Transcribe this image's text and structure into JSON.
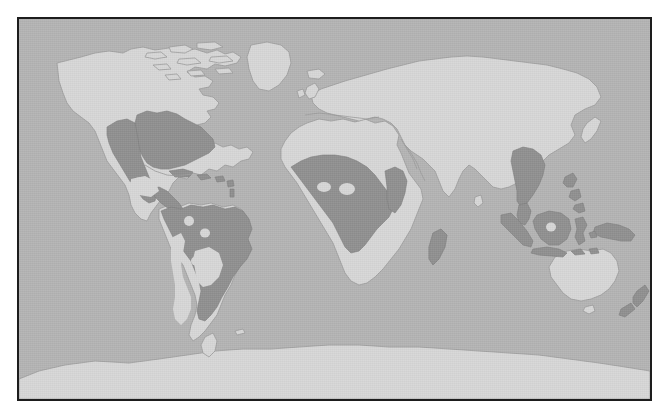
{
  "figure": {
    "kind": "world-distribution-map",
    "projection": "equirectangular",
    "title": "",
    "caption": "",
    "frame": {
      "border_color": "#1d1d1d",
      "border_width_px": 2,
      "x": 17,
      "y": 17,
      "width": 635,
      "height": 384
    }
  },
  "palette": {
    "page_background": "#ffffff",
    "ocean": "#b3b3b3",
    "land_outside_range": "#d6d6d6",
    "land_in_range": "#8f8f8f",
    "coastline_stroke": "#9a9a9a",
    "range_stroke": "#7c7c7c"
  },
  "legend": {
    "present": false,
    "entries": [
      {
        "label": "Distribution range",
        "swatch": "#8f8f8f"
      },
      {
        "label": "Land outside range",
        "swatch": "#d6d6d6"
      },
      {
        "label": "Ocean",
        "swatch": "#b3b3b3"
      }
    ]
  },
  "regions": {
    "shaded_in_range": [
      "Eastern United States",
      "Central United States",
      "Southwestern United States",
      "Mexico (coastal lowlands)",
      "Central America",
      "Caribbean islands",
      "Colombia and Venezuela",
      "Amazon Basin",
      "Brazil",
      "Paraguay",
      "Northern Argentina",
      "West Africa",
      "Central Africa",
      "Congo Basin",
      "East Africa",
      "Madagascar",
      "Southern China",
      "Indochina",
      "Sumatra",
      "Borneo",
      "Java",
      "Philippines",
      "Sulawesi",
      "New Guinea",
      "New Zealand"
    ],
    "not_in_range": [
      "Canada",
      "Alaska",
      "Greenland",
      "Europe",
      "North Africa and Sahara",
      "Southern Africa",
      "Arabian Peninsula",
      "Central Asia",
      "Siberia",
      "India",
      "Northern China",
      "Japan",
      "Australia",
      "Antarctica",
      "Patagonia",
      "Andes",
      "Central Mexican highlands"
    ],
    "interior_gaps": [
      "Central Mexican highlands",
      "Northern Amazon inliers",
      "Central Amazon inlier",
      "Western Amazon inlier",
      "Andean corridor",
      "Central African inliers",
      "Bornean inlier"
    ]
  },
  "map_paths": {
    "graticule_visible": false,
    "labels_visible": false,
    "scale_bar_visible": false
  }
}
